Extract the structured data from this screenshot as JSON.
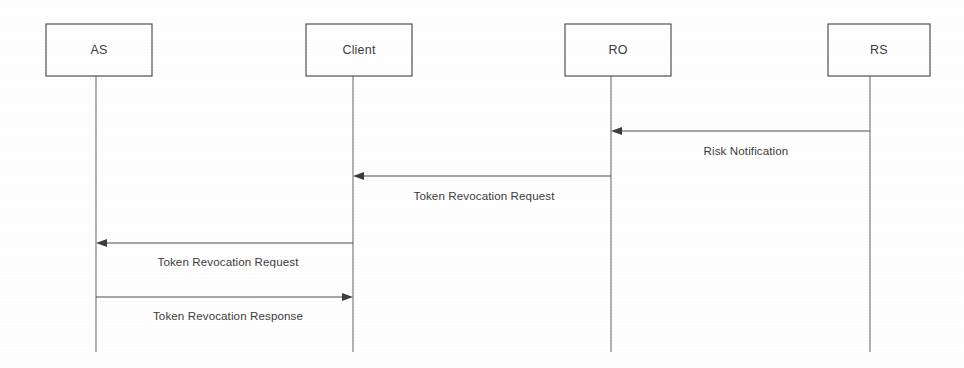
{
  "diagram": {
    "kind": "uml-sequence-diagram",
    "canvas": {
      "width": 964,
      "height": 368
    },
    "style": {
      "background": "#ffffff",
      "box_stroke": "#4a4a4a",
      "lifeline_stroke": "#6b6b6b",
      "message_stroke": "#4d4d4d",
      "text_color": "#3b3b3b"
    },
    "participants": [
      {
        "id": "as",
        "label": "AS",
        "box_x": 46,
        "box_y": 24,
        "box_w": 106,
        "box_h": 52,
        "lifeline_x": 96,
        "lifeline_top": 76,
        "lifeline_bottom": 352
      },
      {
        "id": "client",
        "label": "Client",
        "box_x": 306,
        "box_y": 24,
        "box_w": 106,
        "box_h": 52,
        "lifeline_x": 353,
        "lifeline_top": 76,
        "lifeline_bottom": 352
      },
      {
        "id": "ro",
        "label": "RO",
        "box_x": 565,
        "box_y": 24,
        "box_w": 106,
        "box_h": 52,
        "lifeline_x": 611,
        "lifeline_top": 76,
        "lifeline_bottom": 352
      },
      {
        "id": "rs",
        "label": "RS",
        "box_x": 828,
        "box_y": 24,
        "box_w": 102,
        "box_h": 52,
        "lifeline_x": 870,
        "lifeline_top": 76,
        "lifeline_bottom": 352
      }
    ],
    "messages": [
      {
        "id": "msg-risk-notification",
        "label": "Risk Notification",
        "from": "rs",
        "to": "ro",
        "direction": "left",
        "x_start": 870,
        "x_end": 611,
        "y": 131,
        "label_x": 746,
        "label_y": 155
      },
      {
        "id": "msg-token-revocation-request-ro-client",
        "label": "Token Revocation Request",
        "from": "ro",
        "to": "client",
        "direction": "left",
        "x_start": 611,
        "x_end": 353,
        "y": 176,
        "label_x": 484,
        "label_y": 200
      },
      {
        "id": "msg-token-revocation-request-client-as",
        "label": "Token Revocation Request",
        "from": "client",
        "to": "as",
        "direction": "left",
        "x_start": 353,
        "x_end": 96,
        "y": 243,
        "label_x": 228,
        "label_y": 266
      },
      {
        "id": "msg-token-revocation-response-as-client",
        "label": "Token Revocation Response",
        "from": "as",
        "to": "client",
        "direction": "right",
        "x_start": 96,
        "x_end": 353,
        "y": 297,
        "label_x": 228,
        "label_y": 320
      }
    ]
  }
}
